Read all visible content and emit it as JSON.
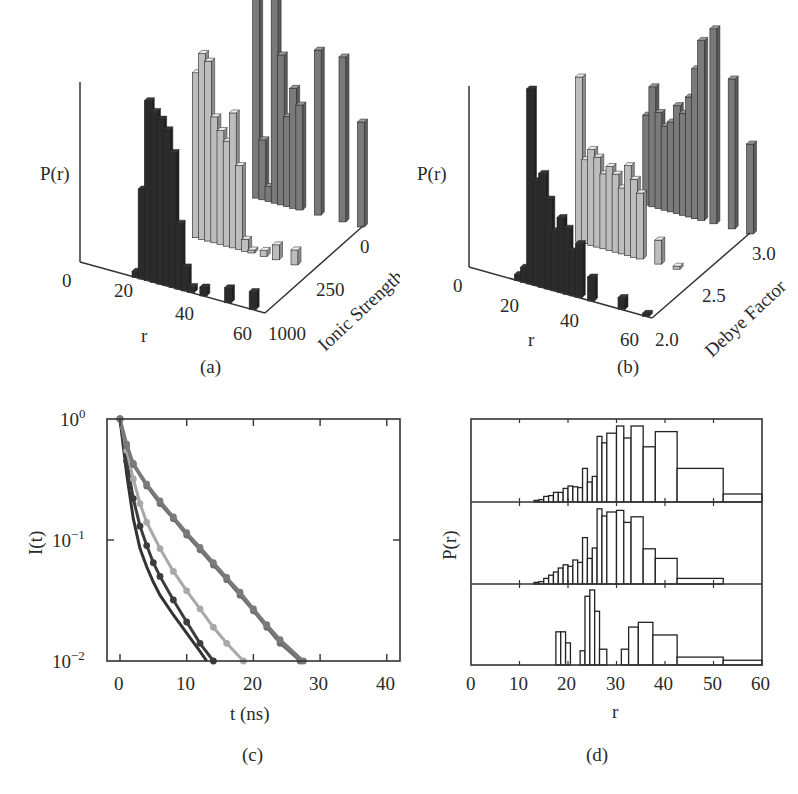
{
  "figure": {
    "captions": {
      "a": "(a)",
      "b": "(b)",
      "c": "(c)",
      "d": "(d)"
    }
  },
  "panel_a": {
    "zlabel": "P(r)",
    "xlabel": "r",
    "ylabel": "Ionic Strength",
    "z_zero": "0",
    "x_ticks": [
      "20",
      "40",
      "60"
    ],
    "y_ticks": [
      "0",
      "250",
      "1000"
    ]
  },
  "panel_b": {
    "zlabel": "P(r)",
    "xlabel": "r",
    "ylabel": "Debye Factor",
    "z_zero": "0",
    "x_ticks": [
      "20",
      "40",
      "60"
    ],
    "y_ticks": [
      "3.0",
      "2.5",
      "2.0"
    ]
  },
  "panel_c": {
    "ylabel": "I(t)",
    "xlabel": "t (ns)",
    "y_ticks": [
      "10",
      "10",
      "10"
    ],
    "y_exps": [
      "0",
      "−1",
      "−2"
    ],
    "x_ticks": [
      "0",
      "10",
      "20",
      "30",
      "40"
    ]
  },
  "panel_d": {
    "ylabel": "P(r)",
    "xlabel": "r",
    "x_ticks": [
      "0",
      "10",
      "20",
      "30",
      "40",
      "50",
      "60"
    ]
  },
  "chart_data": [
    {
      "id": "a",
      "type": "bar",
      "subtype": "3d-bar",
      "title": "",
      "xlabel": "r",
      "ylabel": "Ionic Strength",
      "zlabel": "P(r)",
      "xlim": [
        0,
        60
      ],
      "x_ticks": [
        20,
        40,
        60
      ],
      "y_categories": [
        "0",
        "250",
        "1000"
      ],
      "series": [
        {
          "name": "Ionic Strength 1000",
          "color": "#2b2b2b",
          "r": [
            18,
            20,
            22,
            24,
            26,
            28,
            30,
            32,
            34,
            36,
            40,
            48,
            56
          ],
          "values": [
            0.02,
            0.3,
            0.6,
            0.57,
            0.55,
            0.52,
            0.45,
            0.22,
            0.08,
            0.02,
            0.03,
            0.05,
            0.06
          ]
        },
        {
          "name": "Ionic Strength 250",
          "color": "#bdbdbd",
          "r": [
            22,
            24,
            26,
            28,
            30,
            32,
            34,
            36,
            38,
            40,
            44,
            48,
            54,
            60
          ],
          "values": [
            0.55,
            0.62,
            0.6,
            0.42,
            0.38,
            0.35,
            0.45,
            0.28,
            0.04,
            0.01,
            0.02,
            0.05,
            0.05,
            0.0
          ]
        },
        {
          "name": "Ionic Strength 0",
          "color": "#7a7a7a",
          "r": [
            26,
            28,
            30,
            32,
            34,
            36,
            38,
            40,
            46,
            54,
            60
          ],
          "values": [
            0.75,
            0.2,
            0.05,
            0.7,
            0.5,
            0.3,
            0.4,
            0.35,
            0.55,
            0.55,
            0.35
          ]
        }
      ]
    },
    {
      "id": "b",
      "type": "bar",
      "subtype": "3d-bar",
      "title": "",
      "xlabel": "r",
      "ylabel": "Debye Factor",
      "zlabel": "P(r)",
      "xlim": [
        0,
        60
      ],
      "x_ticks": [
        20,
        40,
        60
      ],
      "y_categories": [
        "2.0",
        "2.5",
        "3.0"
      ],
      "series": [
        {
          "name": "Debye Factor 2.0",
          "color": "#2b2b2b",
          "r": [
            16,
            18,
            20,
            22,
            24,
            26,
            28,
            30,
            32,
            34,
            36,
            40,
            50,
            58
          ],
          "values": [
            0.02,
            0.05,
            0.65,
            0.35,
            0.38,
            0.3,
            0.2,
            0.25,
            0.22,
            0.15,
            0.18,
            0.08,
            0.04,
            0.01
          ]
        },
        {
          "name": "Debye Factor 2.5",
          "color": "#bdbdbd",
          "r": [
            20,
            22,
            24,
            26,
            28,
            30,
            32,
            34,
            36,
            38,
            40,
            46,
            52
          ],
          "values": [
            0.55,
            0.28,
            0.32,
            0.3,
            0.25,
            0.28,
            0.26,
            0.22,
            0.3,
            0.26,
            0.22,
            0.08,
            0.01
          ]
        },
        {
          "name": "Debye Factor 3.0",
          "color": "#7a7a7a",
          "r": [
            26,
            28,
            30,
            32,
            34,
            36,
            38,
            40,
            42,
            44,
            48,
            54,
            60
          ],
          "values": [
            0.3,
            0.4,
            0.32,
            0.28,
            0.3,
            0.36,
            0.34,
            0.4,
            0.5,
            0.6,
            0.65,
            0.5,
            0.3
          ]
        }
      ]
    },
    {
      "id": "c",
      "type": "line",
      "title": "",
      "xlabel": "t (ns)",
      "ylabel": "I(t)",
      "yscale": "log",
      "xlim": [
        -2,
        42
      ],
      "ylim": [
        0.01,
        1.0
      ],
      "x_ticks": [
        0,
        10,
        20,
        30,
        40
      ],
      "y_ticks": [
        "10^0",
        "10^-1",
        "10^-2"
      ],
      "grid": false,
      "legend": null,
      "series": [
        {
          "name": "curve 1 (dark, no markers)",
          "color": "#333333",
          "markers": false,
          "x": [
            0,
            1,
            2,
            3,
            4,
            5,
            6,
            8,
            10,
            12,
            13
          ],
          "y": [
            1.0,
            0.35,
            0.15,
            0.085,
            0.06,
            0.045,
            0.035,
            0.024,
            0.017,
            0.012,
            0.01
          ]
        },
        {
          "name": "curve 2 (dark, markers)",
          "color": "#3c3c3c",
          "markers": true,
          "x": [
            0,
            1,
            2,
            3,
            4,
            5,
            6,
            8,
            10,
            12,
            14
          ],
          "y": [
            1.0,
            0.45,
            0.22,
            0.13,
            0.09,
            0.065,
            0.05,
            0.032,
            0.021,
            0.014,
            0.01
          ]
        },
        {
          "name": "curve 3 (light gray, markers)",
          "color": "#a8a8a8",
          "markers": true,
          "x": [
            0,
            1,
            2,
            3,
            4,
            6,
            8,
            10,
            12,
            14,
            16,
            18.5
          ],
          "y": [
            1.0,
            0.55,
            0.32,
            0.2,
            0.14,
            0.085,
            0.055,
            0.038,
            0.027,
            0.019,
            0.014,
            0.01
          ]
        },
        {
          "name": "curve 4 (mid gray, markers)",
          "color": "#6e6e6e",
          "markers": true,
          "x": [
            0,
            1,
            2,
            4,
            6,
            8,
            10,
            12,
            14,
            16,
            18,
            20,
            22,
            24,
            27
          ],
          "y": [
            1.0,
            0.6,
            0.42,
            0.28,
            0.2,
            0.15,
            0.11,
            0.083,
            0.062,
            0.047,
            0.035,
            0.026,
            0.019,
            0.014,
            0.01
          ]
        },
        {
          "name": "curve 5 (mid gray, markers)",
          "color": "#7a7a7a",
          "markers": true,
          "x": [
            0,
            1,
            2,
            4,
            6,
            8,
            10,
            12,
            14,
            16,
            18,
            20,
            22,
            24,
            27.5
          ],
          "y": [
            1.0,
            0.62,
            0.43,
            0.29,
            0.21,
            0.155,
            0.115,
            0.087,
            0.065,
            0.049,
            0.037,
            0.027,
            0.02,
            0.015,
            0.01
          ]
        }
      ]
    },
    {
      "id": "d",
      "type": "bar",
      "subtype": "stacked-histograms",
      "title": "",
      "xlabel": "r",
      "ylabel": "P(r)",
      "xlim": [
        0,
        60
      ],
      "x_ticks": [
        0,
        10,
        20,
        30,
        40,
        50,
        60
      ],
      "grid": false,
      "series": [
        {
          "name": "top",
          "bins": [
            [
              13,
              14,
              0.02
            ],
            [
              14,
              15,
              0.03
            ],
            [
              15,
              16,
              0.07
            ],
            [
              16,
              17,
              0.08
            ],
            [
              17,
              18,
              0.12
            ],
            [
              18,
              19,
              0.12
            ],
            [
              19,
              20,
              0.17
            ],
            [
              20,
              21,
              0.2
            ],
            [
              21,
              22,
              0.19
            ],
            [
              22,
              23,
              0.18
            ],
            [
              23,
              24,
              0.42
            ],
            [
              24,
              25,
              0.25
            ],
            [
              25,
              26,
              0.32
            ],
            [
              26,
              27,
              0.82
            ],
            [
              27,
              28,
              0.74
            ],
            [
              28,
              30,
              0.86
            ],
            [
              30,
              31.5,
              0.95
            ],
            [
              31.5,
              33,
              0.8
            ],
            [
              33,
              35.5,
              0.95
            ],
            [
              35.5,
              38,
              0.69
            ],
            [
              38,
              42.5,
              0.88
            ],
            [
              42.5,
              52,
              0.42
            ],
            [
              52,
              60,
              0.1
            ]
          ]
        },
        {
          "name": "middle",
          "bins": [
            [
              13,
              14,
              0.02
            ],
            [
              14,
              15,
              0.03
            ],
            [
              15,
              16,
              0.07
            ],
            [
              16,
              17,
              0.11
            ],
            [
              17,
              18,
              0.15
            ],
            [
              18,
              19,
              0.2
            ],
            [
              19,
              20,
              0.24
            ],
            [
              20,
              21,
              0.22
            ],
            [
              21,
              22,
              0.3
            ],
            [
              22,
              23,
              0.27
            ],
            [
              23,
              24,
              0.58
            ],
            [
              24,
              25,
              0.32
            ],
            [
              25,
              26,
              0.45
            ],
            [
              26,
              27,
              0.94
            ],
            [
              27,
              28,
              0.85
            ],
            [
              28,
              30,
              0.9
            ],
            [
              30,
              31.5,
              0.92
            ],
            [
              31.5,
              33,
              0.77
            ],
            [
              33,
              35.5,
              0.84
            ],
            [
              35.5,
              38,
              0.44
            ],
            [
              38,
              42.5,
              0.32
            ],
            [
              42.5,
              52,
              0.07
            ]
          ]
        },
        {
          "name": "bottom",
          "bins": [
            [
              17.5,
              18.5,
              0.42
            ],
            [
              18.5,
              19.5,
              0.42
            ],
            [
              19.5,
              20.5,
              0.28
            ],
            [
              22.5,
              23.5,
              0.18
            ],
            [
              23.5,
              24.5,
              0.87
            ],
            [
              24.5,
              25.5,
              0.95
            ],
            [
              25.5,
              26.5,
              0.68
            ],
            [
              26.5,
              28,
              0.2
            ],
            [
              31,
              32.5,
              0.2
            ],
            [
              32.5,
              34.5,
              0.48
            ],
            [
              34.5,
              37.5,
              0.54
            ],
            [
              37.5,
              42.5,
              0.38
            ],
            [
              42.5,
              52,
              0.1
            ],
            [
              52,
              60,
              0.06
            ]
          ]
        }
      ]
    }
  ]
}
